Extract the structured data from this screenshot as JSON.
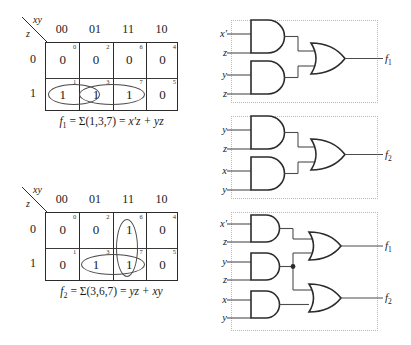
{
  "kmaps": [
    {
      "name": "kmap-f1",
      "corner_top_label": "xy",
      "corner_side_label": "z",
      "col_headers": [
        "00",
        "01",
        "11",
        "10"
      ],
      "row_headers": [
        "0",
        "1"
      ],
      "cells": [
        [
          {
            "index": "0",
            "value": "0"
          },
          {
            "index": "2",
            "value": "0"
          },
          {
            "index": "6",
            "value": "0"
          },
          {
            "index": "4",
            "value": "0"
          }
        ],
        [
          {
            "index": "1",
            "value": "1"
          },
          {
            "index": "3",
            "value": "1"
          },
          {
            "index": "7",
            "value": "1"
          },
          {
            "index": "5",
            "value": "0"
          }
        ]
      ],
      "groups": [
        {
          "name": "group-x-prime-z",
          "cells": [
            "1",
            "3"
          ]
        },
        {
          "name": "group-yz",
          "cells": [
            "3",
            "7"
          ]
        }
      ],
      "equation": "f₁ = Σ(1,3,7) = x′z + yz",
      "equation_parts": {
        "func": "f",
        "sub": "1",
        "minterms": "Σ(1,3,7)",
        "expression": "x′z + yz"
      }
    },
    {
      "name": "kmap-f2",
      "corner_top_label": "xy",
      "corner_side_label": "z",
      "col_headers": [
        "00",
        "01",
        "11",
        "10"
      ],
      "row_headers": [
        "0",
        "1"
      ],
      "cells": [
        [
          {
            "index": "0",
            "value": "0"
          },
          {
            "index": "2",
            "value": "0"
          },
          {
            "index": "6",
            "value": "1"
          },
          {
            "index": "4",
            "value": "0"
          }
        ],
        [
          {
            "index": "1",
            "value": "0"
          },
          {
            "index": "3",
            "value": "1"
          },
          {
            "index": "7",
            "value": "1"
          },
          {
            "index": "5",
            "value": "0"
          }
        ]
      ],
      "groups": [
        {
          "name": "group-xy",
          "cells": [
            "6",
            "7"
          ]
        },
        {
          "name": "group-yz",
          "cells": [
            "3",
            "7"
          ]
        }
      ],
      "equation": "f₂ = Σ(3,6,7) = yz + xy",
      "equation_parts": {
        "func": "f",
        "sub": "2",
        "minterms": "Σ(3,6,7)",
        "expression": "yz + xy"
      }
    }
  ],
  "circuits": [
    {
      "name": "circuit-f1",
      "and_gates": [
        {
          "name": "and-gate-1",
          "inputs": [
            "x′",
            "z"
          ]
        },
        {
          "name": "and-gate-2",
          "inputs": [
            "y",
            "z"
          ]
        }
      ],
      "or_gates": [
        {
          "name": "or-gate-1",
          "output": "f",
          "output_sub": "1"
        }
      ],
      "outputs": [
        {
          "label": "f",
          "sub": "1"
        }
      ]
    },
    {
      "name": "circuit-f2",
      "and_gates": [
        {
          "name": "and-gate-1",
          "inputs": [
            "y",
            "z"
          ]
        },
        {
          "name": "and-gate-2",
          "inputs": [
            "x",
            "y"
          ]
        }
      ],
      "or_gates": [
        {
          "name": "or-gate-1",
          "output": "f",
          "output_sub": "2"
        }
      ],
      "outputs": [
        {
          "label": "f",
          "sub": "2"
        }
      ]
    },
    {
      "name": "circuit-shared",
      "and_gates": [
        {
          "name": "and-gate-1",
          "inputs": [
            "x′",
            "z"
          ]
        },
        {
          "name": "and-gate-2",
          "inputs": [
            "y",
            "z"
          ]
        },
        {
          "name": "and-gate-3",
          "inputs": [
            "x",
            "y"
          ]
        }
      ],
      "or_gates": [
        {
          "name": "or-gate-1",
          "output": "f",
          "output_sub": "1"
        },
        {
          "name": "or-gate-2",
          "output": "f",
          "output_sub": "2"
        }
      ],
      "outputs": [
        {
          "label": "f",
          "sub": "1"
        },
        {
          "label": "f",
          "sub": "2"
        }
      ],
      "shared_node": true
    }
  ]
}
